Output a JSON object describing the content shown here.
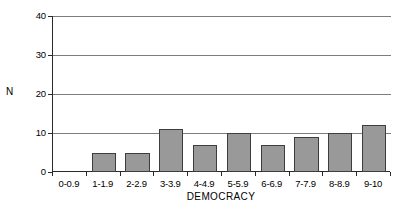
{
  "chart_data": {
    "type": "bar",
    "title": "",
    "subtitle": "",
    "xlabel": "DEMOCRACY",
    "ylabel": "N",
    "categories": [
      "0-0.9",
      "1-1.9",
      "2-2.9",
      "3-3.9",
      "4-4.9",
      "5-5.9",
      "6-6.9",
      "7-7.9",
      "8-8.9",
      "9-10"
    ],
    "values": [
      0,
      5,
      5,
      11,
      7,
      10,
      7,
      9,
      10,
      12
    ],
    "ylim": [
      0,
      40
    ],
    "yticks": [
      0,
      10,
      20,
      30,
      40
    ],
    "ytick_labels": [
      "0",
      "10",
      "20",
      "30",
      "40"
    ],
    "grid": true,
    "grid_axis": "y",
    "legend": false,
    "legend_position": "none",
    "bar_color": "#999999",
    "bar_edge_color": "#3d3d3d",
    "grid_color": "#7d7d7d",
    "axis_color": "#2a2a2a",
    "background_color": "#ffffff"
  }
}
